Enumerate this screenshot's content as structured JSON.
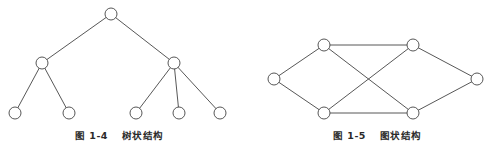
{
  "figures": [
    {
      "id": "tree",
      "caption_number": "图 1-4",
      "caption_title": "树状结构",
      "nodes": [
        {
          "id": "root",
          "x": 111,
          "y": 14
        },
        {
          "id": "l",
          "x": 42,
          "y": 63
        },
        {
          "id": "r",
          "x": 174,
          "y": 63
        },
        {
          "id": "ll",
          "x": 15,
          "y": 113
        },
        {
          "id": "lr",
          "x": 69,
          "y": 113
        },
        {
          "id": "rl",
          "x": 136,
          "y": 113
        },
        {
          "id": "rm",
          "x": 179,
          "y": 113
        },
        {
          "id": "rr",
          "x": 220,
          "y": 113
        }
      ],
      "edges": [
        [
          "root",
          "l"
        ],
        [
          "root",
          "r"
        ],
        [
          "l",
          "ll"
        ],
        [
          "l",
          "lr"
        ],
        [
          "r",
          "rl"
        ],
        [
          "r",
          "rm"
        ],
        [
          "r",
          "rr"
        ]
      ]
    },
    {
      "id": "graph",
      "caption_number": "图 1-5",
      "caption_title": "图状结构",
      "nodes": [
        {
          "id": "a",
          "x": 274,
          "y": 79
        },
        {
          "id": "b",
          "x": 324,
          "y": 45
        },
        {
          "id": "c",
          "x": 413,
          "y": 45
        },
        {
          "id": "d",
          "x": 477,
          "y": 79
        },
        {
          "id": "e",
          "x": 324,
          "y": 113
        },
        {
          "id": "f",
          "x": 413,
          "y": 113
        }
      ],
      "edges": [
        [
          "a",
          "b"
        ],
        [
          "a",
          "e"
        ],
        [
          "b",
          "c"
        ],
        [
          "b",
          "f"
        ],
        [
          "e",
          "c"
        ],
        [
          "e",
          "f"
        ],
        [
          "c",
          "d"
        ],
        [
          "f",
          "d"
        ]
      ]
    }
  ],
  "style": {
    "stroke": "#444444",
    "node_fill": "#ffffff",
    "node_radius": 6
  }
}
